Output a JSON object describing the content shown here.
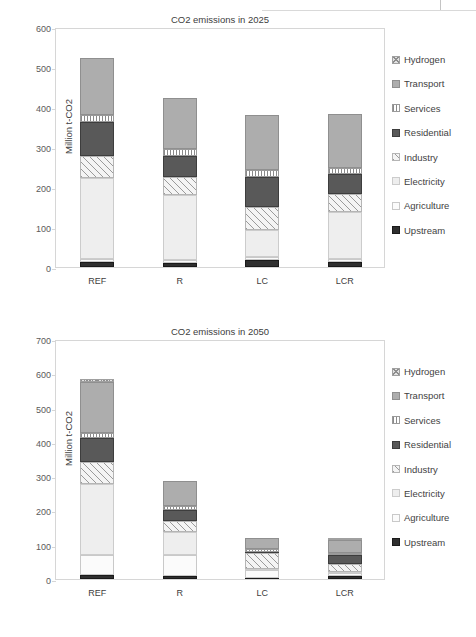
{
  "page_header": {
    "text": "",
    "divider": "vertical-rule"
  },
  "legend": {
    "items": [
      {
        "label": "Hydrogen",
        "fill": "hydrogen"
      },
      {
        "label": "Transport",
        "fill": "transport"
      },
      {
        "label": "Services",
        "fill": "services"
      },
      {
        "label": "Residential",
        "fill": "residential"
      },
      {
        "label": "Industry",
        "fill": "industry"
      },
      {
        "label": "Electricity",
        "fill": "electricity"
      },
      {
        "label": "Agriculture",
        "fill": "agriculture"
      },
      {
        "label": "Upstream",
        "fill": "upstream"
      }
    ]
  },
  "chart_data": [
    {
      "type": "bar",
      "stacked": true,
      "title": "CO2 emissions in 2025",
      "xlabel": "",
      "ylabel": "Million t-CO2",
      "categories": [
        "REF",
        "R",
        "LC",
        "LCR"
      ],
      "ylim": [
        0,
        600
      ],
      "yticks": [
        0,
        100,
        200,
        300,
        400,
        500,
        600
      ],
      "grid": false,
      "legend_position": "right",
      "series": [
        {
          "name": "Upstream",
          "values": [
            13,
            10,
            17,
            13
          ]
        },
        {
          "name": "Agriculture",
          "values": [
            8,
            8,
            8,
            8
          ]
        },
        {
          "name": "Electricity",
          "values": [
            201,
            163,
            67,
            116
          ]
        },
        {
          "name": "Industry",
          "values": [
            56,
            44,
            57,
            45
          ]
        },
        {
          "name": "Residential",
          "values": [
            85,
            53,
            76,
            51
          ]
        },
        {
          "name": "Services",
          "values": [
            18,
            16,
            17,
            15
          ]
        },
        {
          "name": "Transport",
          "values": [
            142,
            128,
            139,
            135
          ]
        },
        {
          "name": "Hydrogen",
          "values": [
            0,
            0,
            0,
            0
          ]
        }
      ],
      "totals": [
        523,
        422,
        381,
        383
      ]
    },
    {
      "type": "bar",
      "stacked": true,
      "title": "CO2 emissions in 2050",
      "xlabel": "",
      "ylabel": "Million t-CO2",
      "categories": [
        "REF",
        "R",
        "LC",
        "LCR"
      ],
      "ylim": [
        0,
        700
      ],
      "yticks": [
        0,
        100,
        200,
        300,
        400,
        500,
        600,
        700
      ],
      "grid": false,
      "legend_position": "right",
      "series": [
        {
          "name": "Upstream",
          "values": [
            11,
            8,
            3,
            8
          ]
        },
        {
          "name": "Agriculture",
          "values": [
            59,
            63,
            24,
            11
          ]
        },
        {
          "name": "Electricity",
          "values": [
            207,
            65,
            2,
            2
          ]
        },
        {
          "name": "Industry",
          "values": [
            65,
            33,
            46,
            24
          ]
        },
        {
          "name": "Residential",
          "values": [
            69,
            32,
            3,
            24
          ]
        },
        {
          "name": "Services",
          "values": [
            16,
            13,
            9,
            7
          ]
        },
        {
          "name": "Transport",
          "values": [
            149,
            73,
            33,
            39
          ]
        },
        {
          "name": "Hydrogen",
          "values": [
            6,
            0,
            0,
            6
          ]
        }
      ],
      "totals": [
        582,
        287,
        120,
        121
      ]
    }
  ]
}
